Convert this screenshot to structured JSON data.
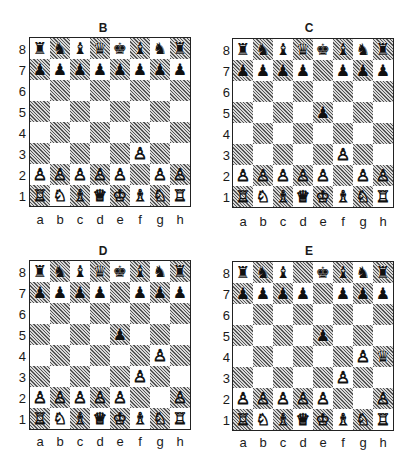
{
  "files": [
    "a",
    "b",
    "c",
    "d",
    "e",
    "f",
    "g",
    "h"
  ],
  "ranks": [
    "8",
    "7",
    "6",
    "5",
    "4",
    "3",
    "2",
    "1"
  ],
  "piece_glyphs": {
    "K": "♔",
    "Q": "♕",
    "R": "♖",
    "B": "♗",
    "N": "♘",
    "P": "♙",
    "k": "♚",
    "q": "♛",
    "r": "♜",
    "b": "♝",
    "n": "♞",
    "p": "♟"
  },
  "colors": {
    "light_square": "#ffffff",
    "dark_square": "#9a9a9a (hatched)",
    "border": "#222222"
  },
  "diagrams": [
    {
      "label": "B",
      "position": [
        "rnbqkbnr",
        "pppppppp",
        "........",
        "........",
        "........",
        ".....P..",
        "PPPPP.PP",
        "RNBQKBNR"
      ]
    },
    {
      "label": "C",
      "position": [
        "rnbqkbnr",
        "pppp.ppp",
        "........",
        "....p...",
        "........",
        ".....P..",
        "PPPPP.PP",
        "RNBQKBNR"
      ]
    },
    {
      "label": "D",
      "position": [
        "rnbqkbnr",
        "pppp.ppp",
        "........",
        "....p...",
        "......P.",
        ".....P..",
        "PPPPP..P",
        "RNBQKBNR"
      ]
    },
    {
      "label": "E",
      "position": [
        "rnb.kbnr",
        "pppp.ppp",
        "........",
        "....p...",
        "......Pq",
        ".....P..",
        "PPPPP..P",
        "RNBQKBNR"
      ]
    }
  ]
}
